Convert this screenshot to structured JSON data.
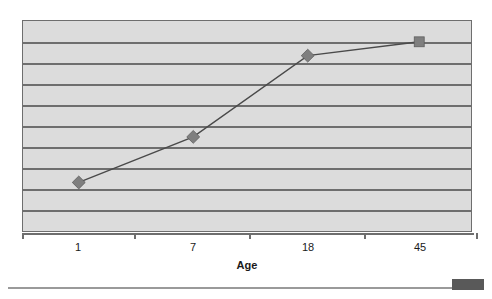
{
  "chart_data": {
    "type": "line",
    "title": "",
    "subtitle": "",
    "xlabel": "Age",
    "ylabel": "",
    "categories": [
      "1",
      "7",
      "18",
      "45"
    ],
    "x_tick_labels": [
      "1",
      "7",
      "18",
      "45"
    ],
    "series": [
      {
        "name": "series-1",
        "values": [
          2.3,
          4.5,
          8.4,
          9.1
        ],
        "line_color": "#4a4a4a",
        "marker_color": "#7f7f7f",
        "markers": [
          "diamond",
          "diamond",
          "diamond",
          "square"
        ]
      }
    ],
    "ylim": [
      0,
      10
    ],
    "xlim": [
      0,
      4
    ],
    "grid": true,
    "gridline_count": 9,
    "legend": "none",
    "legend_position": "none",
    "plot_background": "#dcdcdc",
    "axis_color": "#6e6e6e",
    "points_px": [
      {
        "x": 56,
        "y": 163
      },
      {
        "x": 171,
        "y": 117
      },
      {
        "x": 286,
        "y": 35
      },
      {
        "x": 398,
        "y": 21
      }
    ],
    "gridline_y_px": [
      21,
      42,
      63,
      84,
      105,
      126,
      147,
      168,
      189
    ],
    "tick_x_px": [
      56,
      171,
      286,
      398
    ]
  },
  "axis": {
    "x_title": "Age"
  },
  "footer": {
    "block_label": ""
  }
}
